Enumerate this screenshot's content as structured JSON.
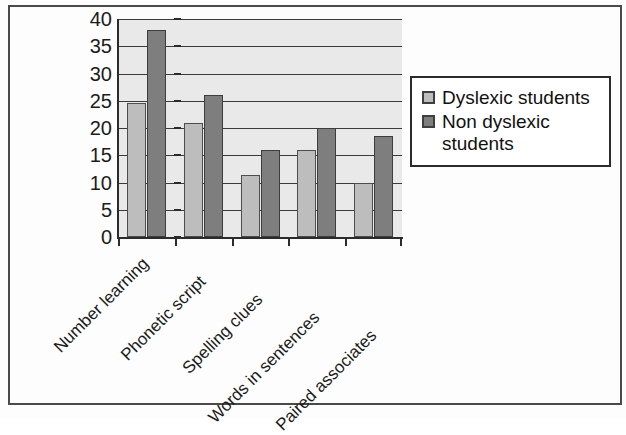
{
  "chart_data": {
    "type": "bar",
    "title": "",
    "subtitle": "",
    "xlabel": "",
    "ylabel": "",
    "ylim": [
      0,
      40
    ],
    "ytick_step": 5,
    "yticks": [
      0,
      5,
      10,
      15,
      20,
      25,
      30,
      35,
      40
    ],
    "grid": true,
    "grid_axis": "y",
    "legend_position": "right",
    "categories": [
      "Number learning",
      "Phonetic script",
      "Spelling clues",
      "Words in sentences",
      "Paired associates"
    ],
    "series": [
      {
        "name": "Dyslexic students",
        "color": "#bdbdbd",
        "values": [
          24.5,
          21,
          11.3,
          16,
          10
        ]
      },
      {
        "name": "Non dyslexic students",
        "color": "#7e7e7e",
        "values": [
          38,
          26,
          16,
          20,
          18.5
        ]
      }
    ]
  },
  "legend": {
    "entries": [
      {
        "label": "Dyslexic students",
        "swatch": "light"
      },
      {
        "label": "Non dyslexic students",
        "swatch": "dark"
      }
    ]
  },
  "colors": {
    "plot_background": "#e9e9e9",
    "page_background": "#fdfdfd",
    "axis": "#2b2b2b",
    "gridline": "#3a3a3a",
    "series_light": "#bdbdbd",
    "series_dark": "#7e7e7e",
    "text": "#1b1b1b"
  }
}
